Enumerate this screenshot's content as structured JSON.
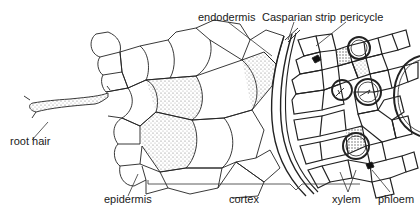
{
  "diagram": {
    "labels": {
      "endodermis": "endodermis",
      "casparian_strip": "Casparian strip",
      "pericycle": "pericycle",
      "root_hair": "root hair",
      "epidermis": "epidermis",
      "cortex": "cortex",
      "xylem": "xylem",
      "phloem": "phloem"
    }
  }
}
